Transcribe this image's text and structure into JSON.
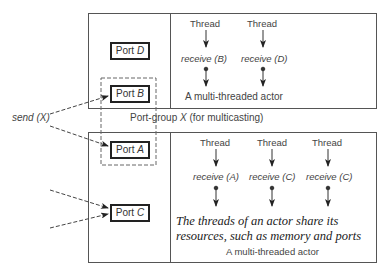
{
  "top_actor": {
    "ports": [
      {
        "name": "Port",
        "id": "D"
      },
      {
        "name": "Port",
        "id": "B"
      }
    ],
    "threads": [
      {
        "label": "Thread",
        "receive": "receive",
        "port": "B"
      },
      {
        "label": "Thread",
        "receive": "receive",
        "port": "D"
      }
    ],
    "caption": "A multi-threaded actor"
  },
  "port_group": {
    "prefix": "Port-group",
    "var": "X",
    "suffix": "(for multicasting)"
  },
  "send": {
    "label": "send",
    "arg": "X"
  },
  "bottom_actor": {
    "ports": [
      {
        "name": "Port",
        "id": "A"
      },
      {
        "name": "Port",
        "id": "C"
      }
    ],
    "threads": [
      {
        "label": "Thread",
        "receive": "receive",
        "port": "A"
      },
      {
        "label": "Thread",
        "receive": "receive",
        "port": "C"
      },
      {
        "label": "Thread",
        "receive": "receive",
        "port": "C"
      }
    ],
    "note_line1": "The threads of an actor share its",
    "note_line2": "resources, such as memory and ports",
    "caption": "A multi-threaded actor"
  }
}
